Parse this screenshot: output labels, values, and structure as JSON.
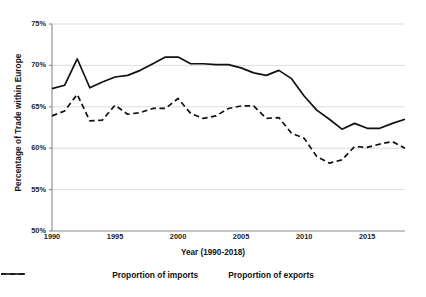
{
  "chart_data": {
    "type": "line",
    "title": "",
    "xlabel": "Year (1990-2018)",
    "ylabel": "Percentage of Trade within Europe",
    "xlim": [
      1990,
      2018
    ],
    "ylim": [
      50,
      75
    ],
    "grid": true,
    "legend_position": "bottom",
    "x_tick_labels": [
      "1990",
      "1995",
      "2000",
      "2005",
      "2010",
      "2015"
    ],
    "x_tick_values": [
      1990,
      1995,
      2000,
      2005,
      2010,
      2015
    ],
    "y_tick_labels": [
      "50%",
      "55%",
      "60%",
      "65%",
      "70%",
      "75%"
    ],
    "y_tick_values": [
      50,
      55,
      60,
      65,
      70,
      75
    ],
    "x": [
      1990,
      1991,
      1992,
      1993,
      1994,
      1995,
      1996,
      1997,
      1998,
      1999,
      2000,
      2001,
      2002,
      2003,
      2004,
      2005,
      2006,
      2007,
      2008,
      2009,
      2010,
      2011,
      2012,
      2013,
      2014,
      2015,
      2016,
      2017,
      2018
    ],
    "series": [
      {
        "name": "Proportion of imports",
        "style": "dashed",
        "color": "#111111",
        "values": [
          63.9,
          64.5,
          66.5,
          63.3,
          63.4,
          65.2,
          64.1,
          64.3,
          64.8,
          64.8,
          66.0,
          64.2,
          63.6,
          63.9,
          64.8,
          65.1,
          65.1,
          63.6,
          63.7,
          61.8,
          61.2,
          59.0,
          58.2,
          58.6,
          60.2,
          60.1,
          60.5,
          60.8,
          60.0
        ]
      },
      {
        "name": "Proportion of exports",
        "style": "solid",
        "color": "#111111",
        "values": [
          67.2,
          67.6,
          70.8,
          67.3,
          68.0,
          68.6,
          68.8,
          69.4,
          70.2,
          71.0,
          71.0,
          70.2,
          70.2,
          70.1,
          70.1,
          69.7,
          69.1,
          68.8,
          69.4,
          68.4,
          66.3,
          64.6,
          63.5,
          62.3,
          63.0,
          62.4,
          62.4,
          63.0,
          63.5
        ]
      }
    ]
  },
  "axis": {
    "y_title": "Percentage of Trade within Europe",
    "x_title": "Year (1990-2018)"
  },
  "legend": {
    "items": [
      {
        "label": "Proportion of imports",
        "style": "dashed"
      },
      {
        "label": "Proportion of exports",
        "style": "solid"
      }
    ]
  }
}
